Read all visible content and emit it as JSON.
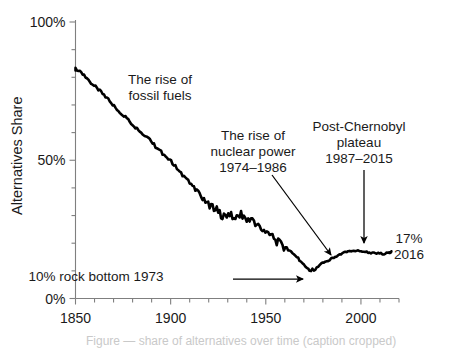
{
  "chart_data": {
    "type": "line",
    "title": "",
    "xlabel": "",
    "ylabel": "Alternatives Share",
    "xlim": [
      1850,
      2020
    ],
    "ylim": [
      0,
      100
    ],
    "grid": false,
    "legend": null,
    "x_ticks": [
      "1850",
      "1900",
      "1950",
      "2000"
    ],
    "x_tick_values": [
      1850,
      1900,
      1950,
      2000
    ],
    "x_minor_tick_step": 10,
    "y_ticks": [
      "0%",
      "50%",
      "100%"
    ],
    "y_tick_values": [
      0,
      50,
      100
    ],
    "y_minor_tick_step": 10,
    "series": [
      {
        "name": "Alternatives Share",
        "color": "#000000",
        "x": [
          1850,
          1853,
          1856,
          1859,
          1862,
          1865,
          1868,
          1871,
          1874,
          1877,
          1880,
          1883,
          1886,
          1889,
          1892,
          1895,
          1898,
          1901,
          1904,
          1907,
          1910,
          1913,
          1916,
          1919,
          1922,
          1925,
          1928,
          1931,
          1934,
          1937,
          1940,
          1943,
          1946,
          1949,
          1952,
          1955,
          1958,
          1961,
          1964,
          1967,
          1970,
          1973,
          1976,
          1979,
          1982,
          1985,
          1988,
          1991,
          1994,
          1997,
          2000,
          2003,
          2006,
          2009,
          2012,
          2015,
          2016
        ],
        "y": [
          83.0,
          81.5,
          79.5,
          77.5,
          75.5,
          73.5,
          71.5,
          69.0,
          67.0,
          65.5,
          63.0,
          61.0,
          59.0,
          57.5,
          55.0,
          53.0,
          51.0,
          49.0,
          46.5,
          44.0,
          42.0,
          39.5,
          37.5,
          35.0,
          33.0,
          31.5,
          29.5,
          31.0,
          28.5,
          30.5,
          27.5,
          29.0,
          26.0,
          24.5,
          23.0,
          21.0,
          19.5,
          18.0,
          16.5,
          14.5,
          12.5,
          10.0,
          10.5,
          12.5,
          13.5,
          14.5,
          15.5,
          16.5,
          17.0,
          17.3,
          17.2,
          16.8,
          16.4,
          16.3,
          16.2,
          16.5,
          17.0
        ]
      }
    ],
    "annotations": [
      {
        "id": "fossil-fuels",
        "lines": [
          "The rise of",
          "fossil fuels"
        ],
        "x": 160,
        "y": 84
      },
      {
        "id": "nuclear-power",
        "lines": [
          "The rise of",
          "nuclear power",
          "1974–1986"
        ],
        "x": 253,
        "y": 140
      },
      {
        "id": "post-chernobyl",
        "lines": [
          "Post-Chernobyl",
          "plateau",
          "1987–2015"
        ],
        "x": 359,
        "y": 131
      },
      {
        "id": "rock-bottom",
        "lines": [
          "10% rock bottom 1973"
        ],
        "x": 96,
        "y": 281
      },
      {
        "id": "end-value",
        "lines": [
          "17%",
          "2016"
        ],
        "x": 409,
        "y": 243
      }
    ],
    "arrows": [
      {
        "id": "nuclear-arrow",
        "x1": 272,
        "y1": 175,
        "x2": 331,
        "y2": 255
      },
      {
        "id": "chernobyl-arrow",
        "x1": 364,
        "y1": 170,
        "x2": 364,
        "y2": 243
      },
      {
        "id": "rock-bottom-arrow",
        "x1": 233,
        "y1": 279,
        "x2": 303,
        "y2": 279
      }
    ],
    "callout_values": {
      "start_year": 1850,
      "start_value": 83,
      "trough_year": 1973,
      "trough_value": 10,
      "end_year": 2016,
      "end_value": 17
    }
  },
  "caption": {
    "text": "Figure — share of alternatives over time (caption cropped)"
  },
  "colors": {
    "line": "#000000",
    "axis": "#7f7f7f",
    "text": "#1a1a1a",
    "background": "#ffffff"
  }
}
